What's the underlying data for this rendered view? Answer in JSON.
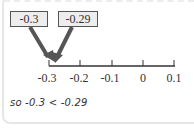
{
  "boxes": [
    {
      "label": "-0.3"
    },
    {
      "label": "-0.29"
    }
  ],
  "number_line": {
    "ticks": [
      "-0.3",
      "-0.2",
      "-0.1",
      "0",
      "0.1"
    ]
  },
  "conclusion": "so -0.3 < -0.29",
  "colors": {
    "arrow": "#555555",
    "box_fill": "#ededed",
    "line": "#333333"
  }
}
